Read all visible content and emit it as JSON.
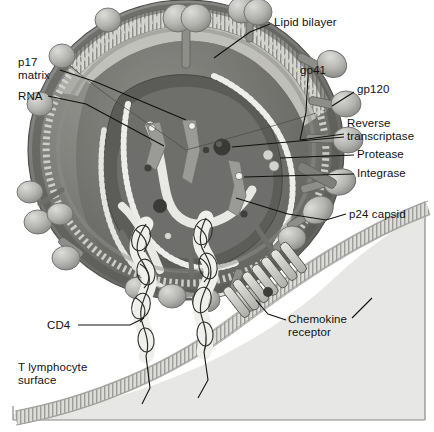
{
  "figure": {
    "style": "grayscale scientific illustration, cutaway view"
  },
  "palette": {
    "background": "#ffffff",
    "frame_line": "#8a8a8a",
    "cytoplasm": "#e7e7e5",
    "envelope_outer_dark": "#6e6e6e",
    "envelope_mid": "#8c8c8c",
    "bilayer_light": "#d9d9d6",
    "matrix_band": "#cfcfca",
    "capsid_dark": "#585858",
    "capsid_core": "#767676",
    "spike_knob": "#b9b9b5",
    "spike_knob_shade": "#9a9a96",
    "rna_dot": "#ececea",
    "enzyme_dark": "#4a4a4a",
    "enzyme_light": "#e2e2e0",
    "membrane_band": "#cdcdc9",
    "leader_line": "#111111",
    "text": "#121212"
  },
  "labels": [
    {
      "id": "lipid-bilayer",
      "text": "Lipid bilayer",
      "x": 274,
      "y": 16,
      "lines": [
        "Lipid bilayer"
      ]
    },
    {
      "id": "p17-matrix",
      "text": "p17 matrix",
      "x": 18,
      "y": 56,
      "lines": [
        "p17",
        "matrix"
      ]
    },
    {
      "id": "rna",
      "text": "RNA",
      "x": 18,
      "y": 90,
      "lines": [
        "RNA"
      ]
    },
    {
      "id": "gp41",
      "text": "gp41",
      "x": 300,
      "y": 64,
      "lines": [
        "gp41"
      ]
    },
    {
      "id": "gp120",
      "text": "gp120",
      "x": 357,
      "y": 83,
      "lines": [
        "gp120"
      ]
    },
    {
      "id": "reverse-transcriptase",
      "text": "Reverse transcriptase",
      "x": 347,
      "y": 117,
      "lines": [
        "Reverse",
        "transcriptase"
      ]
    },
    {
      "id": "protease",
      "text": "Protease",
      "x": 357,
      "y": 148,
      "lines": [
        "Protease"
      ]
    },
    {
      "id": "integrase",
      "text": "Integrase",
      "x": 357,
      "y": 167,
      "lines": [
        "Integrase"
      ]
    },
    {
      "id": "p24-capsid",
      "text": "p24 capsid",
      "x": 349,
      "y": 208,
      "lines": [
        "p24 capsid"
      ]
    },
    {
      "id": "chemokine-receptor",
      "text": "Chemokine receptor",
      "x": 288,
      "y": 313,
      "lines": [
        "Chemokine",
        "receptor"
      ]
    },
    {
      "id": "cd4",
      "text": "CD4",
      "x": 47,
      "y": 319,
      "lines": [
        "CD4"
      ]
    },
    {
      "id": "t-lymphocyte-surface",
      "text": "T lymphocyte surface",
      "x": 18,
      "y": 361,
      "lines": [
        "T lymphocyte",
        "surface"
      ]
    }
  ],
  "structures": {
    "virion": {
      "name": "HIV virion",
      "cx": 186,
      "cy": 150,
      "rx": 158,
      "ry": 150
    },
    "envelope": {
      "name": "viral envelope with lipid bilayer"
    },
    "capsid": {
      "name": "p24 conical capsid"
    },
    "rna_strands": {
      "name": "RNA genome, two beaded strands",
      "count": 2
    },
    "reverse_transcriptase": {
      "name": "reverse transcriptase",
      "cx": 222,
      "cy": 147,
      "r": 8
    },
    "protease": {
      "name": "protease",
      "cx": 272,
      "cy": 160,
      "r": 5,
      "count": 2
    },
    "integrase": {
      "name": "integrase",
      "cx": 239,
      "cy": 176,
      "r": 4
    },
    "gp120_spikes": {
      "name": "gp120 surface knobs",
      "count": 18
    },
    "gp41_stalks": {
      "name": "gp41 transmembrane stalks",
      "count": 18
    },
    "cell_membrane": {
      "name": "T lymphocyte plasma membrane"
    },
    "cd4_receptors": {
      "name": "CD4 receptor",
      "count": 2
    },
    "chemokine_receptor": {
      "name": "chemokine co-receptor, 7 helices",
      "cx": 250,
      "cy": 290
    }
  }
}
